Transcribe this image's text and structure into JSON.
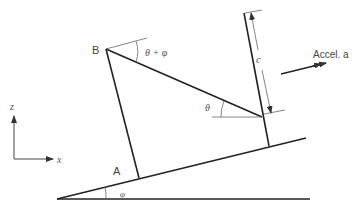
{
  "diagram": {
    "labels": {
      "point_b": "B",
      "point_a": "A",
      "angle_top": "θ + φ",
      "angle_theta": "θ",
      "angle_phi": "φ",
      "dimension_c": "c",
      "accel": "Accel. a",
      "axis_z": "z",
      "axis_x": "x"
    },
    "colors": {
      "stroke_main": "#222222",
      "stroke_thin": "#555555",
      "text": "#444444"
    }
  }
}
